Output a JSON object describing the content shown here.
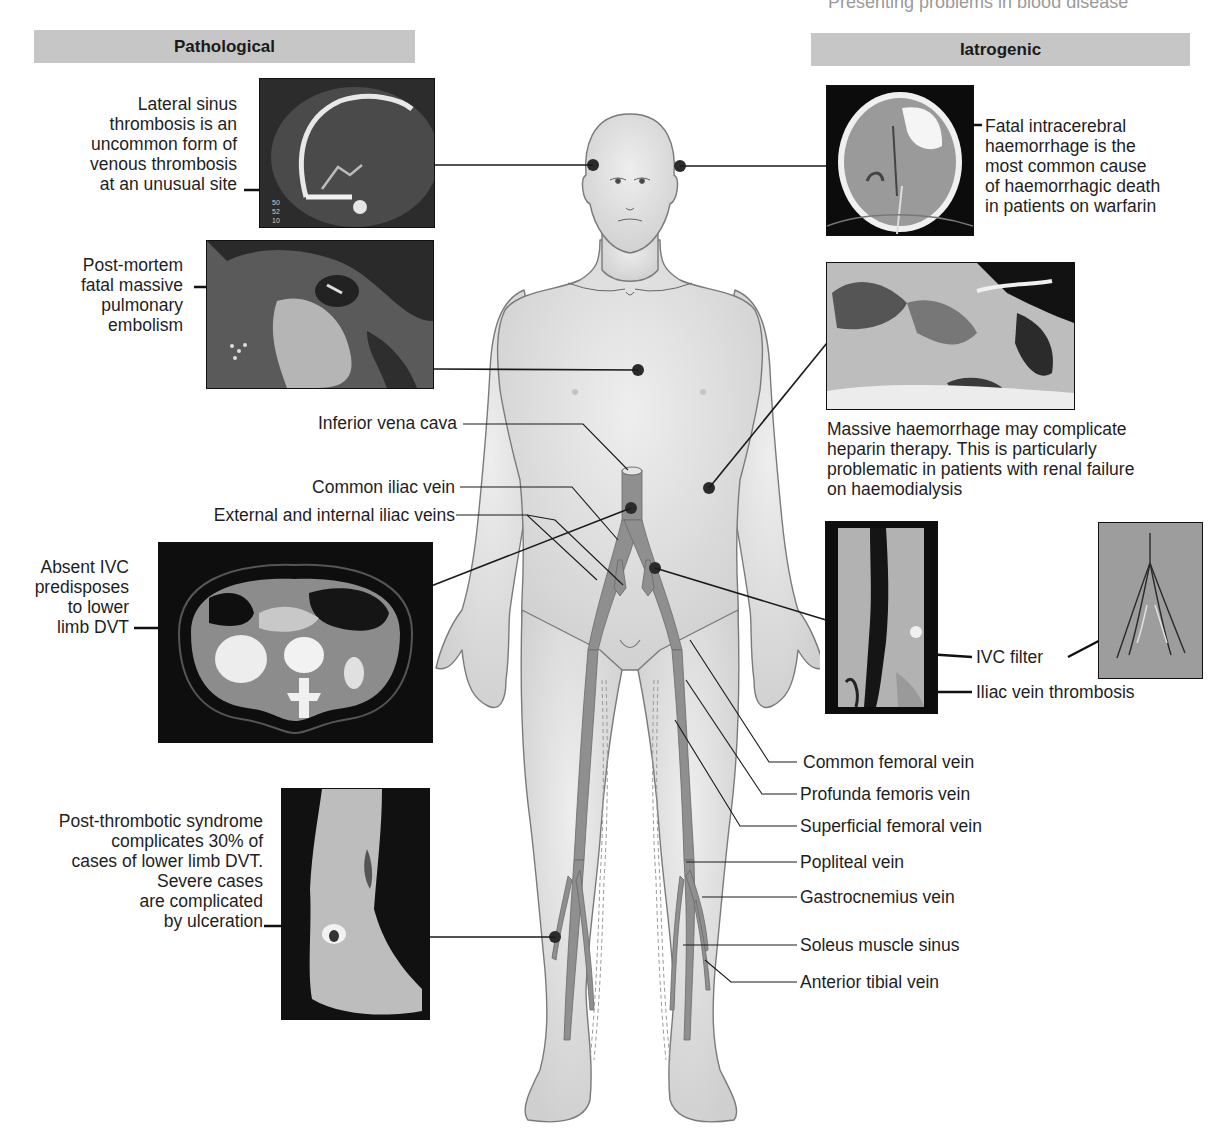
{
  "running_head": "Presenting problems in blood disease",
  "sections": {
    "left": {
      "title": "Pathological"
    },
    "right": {
      "title": "Iatrogenic"
    }
  },
  "pathological": [
    {
      "id": "lateral-sinus",
      "caption_lines": [
        "Lateral sinus",
        "thrombosis is an",
        "uncommon form of",
        "venous thrombosis",
        "at an unusual site"
      ],
      "image": "MR venogram of head (sagittal)",
      "image_annotation": "50 52 10",
      "site": "head"
    },
    {
      "id": "pulmonary-embolism",
      "caption_lines": [
        "Post-mortem",
        "fatal massive",
        "pulmonary",
        "embolism"
      ],
      "image": "post-mortem lung section",
      "site": "chest"
    },
    {
      "id": "absent-ivc",
      "caption_lines": [
        "Absent IVC",
        "predisposes",
        "to lower",
        "limb DVT"
      ],
      "image": "axial abdominal CT",
      "site": "IVC"
    },
    {
      "id": "post-thrombotic",
      "caption_lines": [
        "Post-thrombotic syndrome",
        "complicates 30% of",
        "cases of lower limb DVT.",
        "Severe cases",
        "are complicated",
        "by ulceration"
      ],
      "image": "leg with venous ulcer",
      "site": "lower leg"
    }
  ],
  "iatrogenic": [
    {
      "id": "intracerebral-haemorrhage",
      "caption_lines": [
        "Fatal intracerebral",
        "haemorrhage is the",
        "most common cause",
        "of haemorrhagic death",
        "in patients on warfarin"
      ],
      "image": "axial head CT",
      "site": "head"
    },
    {
      "id": "heparin-haemorrhage",
      "caption_lines": [
        "Massive haemorrhage may complicate",
        "heparin therapy. This is particularly",
        "problematic in patients with renal failure",
        "on haemodialysis"
      ],
      "image": "abdominal wall haematoma",
      "site": "flank"
    },
    {
      "id": "ivc-filter",
      "labels": {
        "filter": "IVC filter",
        "thrombosis": "Iliac vein thrombosis"
      },
      "image": "venogram and IVC filter radiograph",
      "site": "iliac vein"
    }
  ],
  "vein_labels_left": [
    {
      "label": "Inferior vena cava"
    },
    {
      "label": "Common iliac vein"
    },
    {
      "label": "External and internal iliac veins"
    }
  ],
  "vein_labels_right": [
    {
      "label": "Common femoral vein"
    },
    {
      "label": "Profunda femoris vein"
    },
    {
      "label": "Superficial femoral vein"
    },
    {
      "label": "Popliteal vein"
    },
    {
      "label": "Gastrocnemius vein"
    },
    {
      "label": "Soleus muscle sinus"
    },
    {
      "label": "Anterior tibial vein"
    }
  ],
  "colors": {
    "section_bar": "#c6c6c6",
    "skin": "#dcdcdc",
    "skin_outline": "#7a7a7a",
    "vein": "#8f8f8f",
    "marker": "#2b2b2b",
    "leader": "#1a1a1a"
  }
}
